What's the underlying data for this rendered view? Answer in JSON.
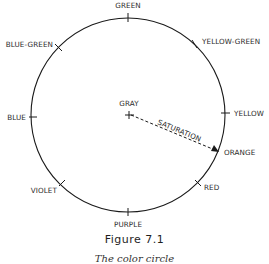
{
  "figure": {
    "title": "Figure 7.1",
    "subtitle": "The color circle"
  },
  "diagram": {
    "type": "color-circle",
    "center_label": "GRAY",
    "axis_label": "SATURATION",
    "hues": [
      {
        "name": "GREEN",
        "position": "top"
      },
      {
        "name": "YELLOW-GREEN",
        "position": "top-right"
      },
      {
        "name": "YELLOW",
        "position": "right"
      },
      {
        "name": "ORANGE",
        "position": "right-lower"
      },
      {
        "name": "RED",
        "position": "bottom-right"
      },
      {
        "name": "PURPLE",
        "position": "bottom"
      },
      {
        "name": "VIOLET",
        "position": "bottom-left"
      },
      {
        "name": "BLUE",
        "position": "left"
      },
      {
        "name": "BLUE-GREEN",
        "position": "top-left"
      }
    ],
    "colors": {
      "line": "#1a1a1a",
      "text": "#2a2a2a",
      "background": "#ffffff"
    }
  }
}
